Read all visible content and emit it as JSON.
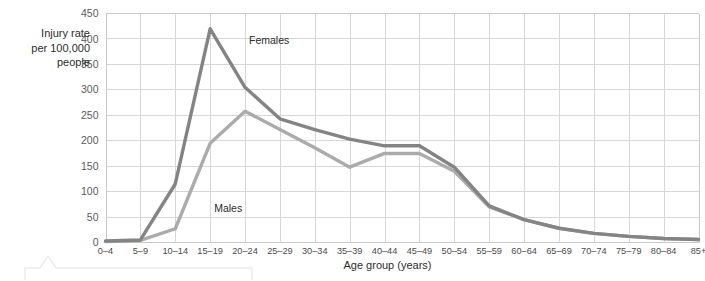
{
  "chart_data": {
    "type": "line",
    "title": "",
    "xlabel": "Age group (years)",
    "ylabel": "Injury rate\nper 100,000\npeople",
    "ylim": [
      0,
      450
    ],
    "ytick_step": 50,
    "yticks": [
      "0",
      "50",
      "100",
      "150",
      "200",
      "250",
      "300",
      "350",
      "400",
      "450"
    ],
    "grid": true,
    "legend_position": "inline-annotation",
    "categories": [
      "0–4",
      "5–9",
      "10–14",
      "15–19",
      "20–24",
      "25–29",
      "30–34",
      "35–39",
      "40–44",
      "45–49",
      "50–54",
      "55–59",
      "60–64",
      "65–69",
      "70–74",
      "75–79",
      "80–84",
      "85+"
    ],
    "series": [
      {
        "name": "Females",
        "color": "#848484",
        "values": [
          3,
          5,
          115,
          420,
          305,
          243,
          222,
          203,
          190,
          190,
          148,
          72,
          45,
          28,
          18,
          12,
          8,
          6
        ]
      },
      {
        "name": "Males",
        "color": "#ababab",
        "values": [
          2,
          4,
          27,
          195,
          258,
          222,
          186,
          148,
          175,
          175,
          140,
          70,
          45,
          28,
          18,
          12,
          8,
          6
        ]
      }
    ],
    "annotations": [
      {
        "text": "Females",
        "category": "20–24",
        "value": 390
      },
      {
        "text": "Males",
        "category": "15–19",
        "value": 60
      }
    ]
  },
  "decor": {
    "callout_name": "callout-outline"
  }
}
